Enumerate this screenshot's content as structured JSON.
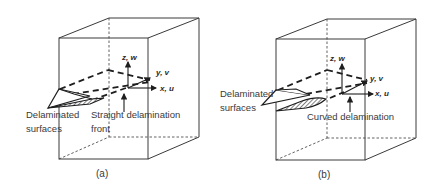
{
  "figure": {
    "panels": [
      {
        "caption": "(a)",
        "axes": {
          "z": "z, w",
          "y": "y, v",
          "x": "x, u"
        },
        "labels": {
          "surfaces_line1": "Delaminated",
          "surfaces_line2": "surfaces",
          "front_line1": "Straight delamination",
          "front_line2": "front"
        }
      },
      {
        "caption": "(b)",
        "axes": {
          "z": "z, w",
          "y": "y, v",
          "x": "x, u"
        },
        "labels": {
          "surfaces_line1": "Delaminated",
          "surfaces_line2": "surfaces",
          "front_line1": "Curved delamination"
        }
      }
    ]
  }
}
